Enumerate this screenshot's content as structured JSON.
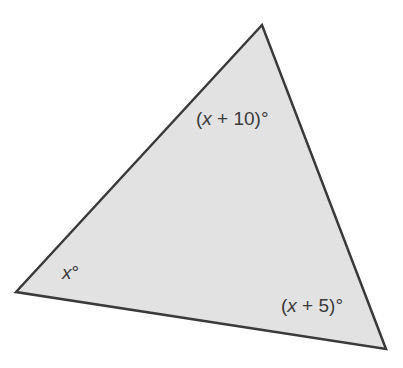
{
  "diagram": {
    "type": "triangle",
    "fill": "#e2e2e2",
    "stroke": "#3a3a3a",
    "vertices": {
      "left": [
        16,
        292
      ],
      "top": [
        262,
        25
      ],
      "bottom_right": [
        386,
        349
      ]
    },
    "angles": {
      "top": {
        "prefix": "(",
        "var": "x",
        "suffix": " + 10)°"
      },
      "left": {
        "prefix": "",
        "var": "x",
        "suffix": "°"
      },
      "bottom_right": {
        "prefix": "(",
        "var": "x",
        "suffix": " + 5)°"
      }
    }
  }
}
